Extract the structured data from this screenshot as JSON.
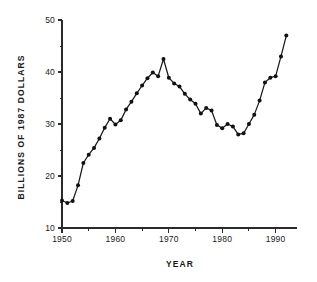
{
  "chart_data": {
    "type": "line",
    "title": "",
    "subtitle": "",
    "xlabel": "YEAR",
    "ylabel": "BILLIONS OF 1987 DOLLARS",
    "xlim": [
      1950,
      1994
    ],
    "ylim": [
      10,
      50
    ],
    "grid": false,
    "legend": null,
    "legend_position": "none",
    "x_major_ticks": [
      1950,
      1960,
      1970,
      1980,
      1990
    ],
    "x_major_tick_labels": [
      "1950",
      "1960",
      "1970",
      "1980",
      "1990"
    ],
    "x_minor_ticks": [
      1955,
      1965,
      1975,
      1985
    ],
    "y_major_ticks": [
      10,
      20,
      30,
      40,
      50
    ],
    "y_major_tick_labels": [
      "10",
      "20",
      "30",
      "40",
      "50"
    ],
    "y_minor_ticks": [
      15,
      25,
      35,
      45
    ],
    "marker": "filled-circle",
    "line_color": "#1a1a1a",
    "marker_color": "#111111",
    "x": [
      1950,
      1951,
      1952,
      1953,
      1954,
      1955,
      1956,
      1957,
      1958,
      1959,
      1960,
      1961,
      1962,
      1963,
      1964,
      1965,
      1966,
      1967,
      1968,
      1969,
      1970,
      1971,
      1972,
      1973,
      1974,
      1975,
      1976,
      1977,
      1978,
      1979,
      1980,
      1981,
      1982,
      1983,
      1984,
      1985,
      1986,
      1987,
      1988,
      1989,
      1990,
      1991,
      1992
    ],
    "values": [
      15.3,
      14.8,
      15.2,
      18.2,
      22.5,
      24.1,
      25.4,
      27.2,
      29.3,
      31.0,
      29.9,
      30.7,
      32.8,
      34.3,
      35.9,
      37.4,
      38.8,
      39.9,
      39.2,
      42.5,
      38.9,
      37.8,
      37.2,
      35.8,
      34.7,
      33.9,
      32.0,
      33.1,
      32.6,
      29.8,
      29.2,
      30.0,
      29.5,
      28.0,
      28.2,
      30.0,
      31.8,
      34.5,
      38.0,
      38.9,
      39.2,
      43.0,
      47.0
    ]
  },
  "axes": {
    "y_title": "BILLIONS OF 1987 DOLLARS",
    "x_title": "YEAR"
  }
}
